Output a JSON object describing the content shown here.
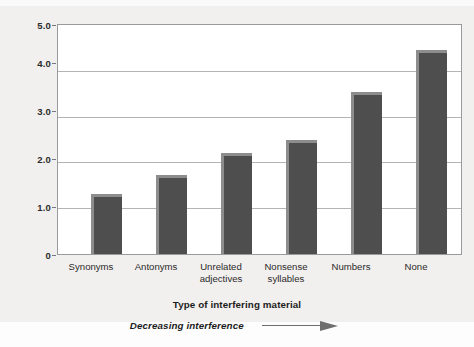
{
  "chart_data": {
    "type": "bar",
    "title": "",
    "categories": [
      "Synonyms",
      "Antonyms",
      "Unrelated adjectives",
      "Nonsense syllables",
      "Numbers",
      "None"
    ],
    "category_lines": [
      [
        "Synonyms"
      ],
      [
        "Antonyms"
      ],
      [
        "Unrelated",
        "adjectives"
      ],
      [
        "Nonsense",
        "syllables"
      ],
      [
        "Numbers"
      ],
      [
        "None"
      ]
    ],
    "values": [
      1.3,
      1.72,
      2.2,
      2.48,
      3.54,
      4.45
    ],
    "xlabel": "Type of interfering material",
    "ylabel": "Mean number of test items recalled",
    "ylim": [
      0,
      5.0
    ],
    "yticks": [
      "0",
      "1.0",
      "2.0",
      "3.0",
      "4.0",
      "5.0"
    ],
    "ytick_values": [
      0,
      1.0,
      2.0,
      3.0,
      4.0,
      5.0
    ],
    "grid": "horizontal",
    "legend": "none",
    "bar_color": "#4e4e4e",
    "bar_highlight_color": "#8d8d8d",
    "gridline_color": "#b4b4b4",
    "plot_background": "#ffffff",
    "figure_background": "#f2f0ee",
    "annotation": {
      "text": "Decreasing interference",
      "icon": "right-arrow-icon",
      "direction": "right"
    }
  }
}
